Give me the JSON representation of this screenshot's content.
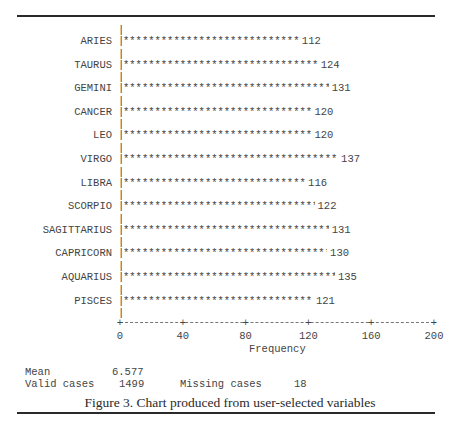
{
  "chart_data": {
    "type": "bar",
    "orientation": "horizontal",
    "style": "ascii-asterisk",
    "categories": [
      "ARIES",
      "TAURUS",
      "GEMINI",
      "CANCER",
      "LEO",
      "VIRGO",
      "LIBRA",
      "SCORPIO",
      "SAGITTARIUS",
      "CAPRICORN",
      "AQUARIUS",
      "PISCES"
    ],
    "values": [
      112,
      124,
      131,
      120,
      120,
      137,
      116,
      122,
      131,
      130,
      135,
      121
    ],
    "title": "",
    "xlabel": "Frequency",
    "ylabel": "",
    "xlim": [
      0,
      200
    ],
    "xticks": [
      0,
      40,
      80,
      120,
      160,
      200
    ],
    "grid": false,
    "legend": null
  },
  "axis": {
    "xlabel": "Frequency",
    "ticks": [
      "0",
      "40",
      "80",
      "120",
      "160",
      "200"
    ]
  },
  "stats": {
    "mean_label": "Mean",
    "mean_value": "6.577",
    "valid_label": "Valid cases",
    "valid_value": "1499",
    "missing_label": "Missing cases",
    "missing_value": "18"
  },
  "caption": "Figure 3. Chart produced from user-selected variables",
  "colors": {
    "text": "#444444",
    "rule": "#2a2a2a"
  }
}
